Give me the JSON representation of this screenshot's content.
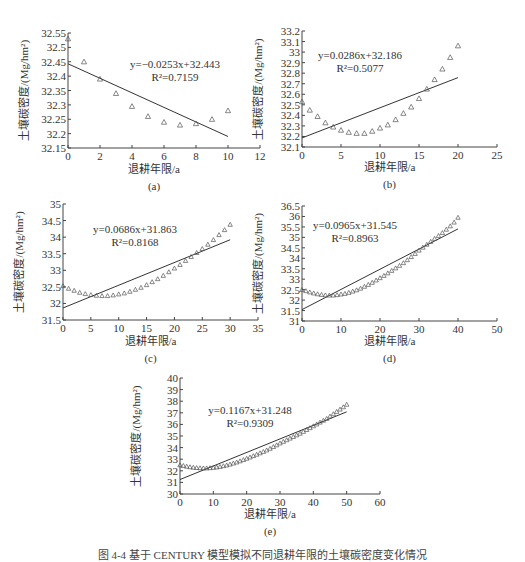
{
  "figure": {
    "caption": "图 4-4  基于 CENTURY 模型模拟不同退耕年限的土壤碳密度变化情况"
  },
  "common": {
    "ylabel": "土壤碳密度/(Mg/hm²)",
    "xlabel": "退耕年限/a"
  },
  "chart_data": [
    {
      "id": "a",
      "type": "scatter",
      "label": "(a)",
      "title": "",
      "xlabel": "退耕年限/a",
      "ylabel": "土壤碳密度/(Mg/hm²)",
      "xlim": [
        0,
        12
      ],
      "ylim": [
        32.15,
        32.55
      ],
      "xticks": [
        0,
        2,
        4,
        6,
        8,
        10,
        12
      ],
      "yticks": [
        32.15,
        32.2,
        32.25,
        32.3,
        32.35,
        32.4,
        32.45,
        32.5,
        32.55
      ],
      "ytick_labels": [
        "32.15",
        "32.2",
        "32.25",
        "32.3",
        "32.35",
        "32.4",
        "32.45",
        "32.5",
        "32.55"
      ],
      "x": [
        0,
        1,
        2,
        3,
        4,
        5,
        6,
        7,
        8,
        9,
        10
      ],
      "values": [
        32.53,
        32.45,
        32.39,
        32.34,
        32.295,
        32.26,
        32.24,
        32.23,
        32.235,
        32.25,
        32.28
      ],
      "trendline": {
        "slope": -0.0253,
        "intercept": 32.443,
        "x_range": [
          0,
          10
        ]
      },
      "equation": "y=−0.0253x+32.443",
      "r2": "R²=0.7159",
      "grid": false,
      "legend": "none"
    },
    {
      "id": "b",
      "type": "scatter",
      "label": "(b)",
      "title": "",
      "xlabel": "退耕年限/a",
      "ylabel": "土壤碳密度/(Mg/hm²)",
      "xlim": [
        0,
        25
      ],
      "ylim": [
        32.1,
        33.2
      ],
      "xticks": [
        0,
        5,
        10,
        15,
        20,
        25
      ],
      "yticks": [
        32.1,
        32.2,
        32.3,
        32.4,
        32.5,
        32.6,
        32.7,
        32.8,
        32.9,
        33,
        33.1,
        33.2
      ],
      "ytick_labels": [
        "32.1",
        "32.2",
        "32.3",
        "32.4",
        "32.5",
        "32.6",
        "32.7",
        "32.8",
        "32.9",
        "33",
        "33.1",
        "33.2"
      ],
      "x": [
        0,
        1,
        2,
        3,
        4,
        5,
        6,
        7,
        8,
        9,
        10,
        11,
        12,
        13,
        14,
        15,
        16,
        17,
        18,
        19,
        20
      ],
      "values": [
        32.53,
        32.45,
        32.39,
        32.33,
        32.29,
        32.26,
        32.24,
        32.23,
        32.23,
        32.25,
        32.28,
        32.31,
        32.36,
        32.42,
        32.48,
        32.56,
        32.65,
        32.74,
        32.84,
        32.95,
        33.06
      ],
      "trendline": {
        "slope": 0.0286,
        "intercept": 32.186,
        "x_range": [
          0,
          20
        ]
      },
      "equation": "y=0.0286x+32.186",
      "r2": "R²=0.5077",
      "grid": false,
      "legend": "none"
    },
    {
      "id": "c",
      "type": "scatter",
      "label": "(c)",
      "title": "",
      "xlabel": "退耕年限/a",
      "ylabel": "土壤碳密度/(Mg/hm²)",
      "xlim": [
        0,
        35
      ],
      "ylim": [
        31.5,
        35
      ],
      "xticks": [
        0,
        5,
        10,
        15,
        20,
        25,
        30,
        35
      ],
      "yticks": [
        31.5,
        32,
        32.5,
        33,
        33.5,
        34,
        34.5,
        35
      ],
      "ytick_labels": [
        "31.5",
        "32",
        "32.5",
        "33",
        "33.5",
        "34",
        "34.5",
        "35"
      ],
      "x": [
        0,
        1,
        2,
        3,
        4,
        5,
        6,
        7,
        8,
        9,
        10,
        11,
        12,
        13,
        14,
        15,
        16,
        17,
        18,
        19,
        20,
        21,
        22,
        23,
        24,
        25,
        26,
        27,
        28,
        29,
        30
      ],
      "values": [
        32.53,
        32.45,
        32.39,
        32.33,
        32.29,
        32.26,
        32.24,
        32.23,
        32.23,
        32.25,
        32.28,
        32.31,
        32.36,
        32.42,
        32.48,
        32.56,
        32.65,
        32.74,
        32.84,
        32.95,
        33.06,
        33.17,
        33.29,
        33.41,
        33.53,
        33.65,
        33.78,
        33.92,
        34.07,
        34.22,
        34.38
      ],
      "trendline": {
        "slope": 0.0686,
        "intercept": 31.863,
        "x_range": [
          0,
          30
        ]
      },
      "equation": "y=0.0686x+31.863",
      "r2": "R²=0.8168",
      "grid": false,
      "legend": "none"
    },
    {
      "id": "d",
      "type": "scatter",
      "label": "(d)",
      "title": "",
      "xlabel": "退耕年限/a",
      "ylabel": "土壤碳密度/(Mg/hm²)",
      "xlim": [
        0,
        50
      ],
      "ylim": [
        31,
        36.5
      ],
      "xticks": [
        0,
        10,
        20,
        30,
        40,
        50
      ],
      "yticks": [
        31,
        31.5,
        32,
        32.5,
        33,
        33.5,
        34,
        34.5,
        35,
        35.5,
        36,
        36.5
      ],
      "ytick_labels": [
        "31",
        "31.5",
        "32",
        "32.5",
        "33",
        "33.5",
        "34",
        "34.5",
        "35",
        "35.5",
        "36",
        "36.5"
      ],
      "x": [
        0,
        1,
        2,
        3,
        4,
        5,
        6,
        7,
        8,
        9,
        10,
        11,
        12,
        13,
        14,
        15,
        16,
        17,
        18,
        19,
        20,
        21,
        22,
        23,
        24,
        25,
        26,
        27,
        28,
        29,
        30,
        31,
        32,
        33,
        34,
        35,
        36,
        37,
        38,
        39,
        40
      ],
      "values": [
        32.5,
        32.44,
        32.38,
        32.33,
        32.29,
        32.26,
        32.24,
        32.23,
        32.23,
        32.25,
        32.28,
        32.31,
        32.36,
        32.42,
        32.48,
        32.56,
        32.65,
        32.74,
        32.84,
        32.95,
        33.06,
        33.17,
        33.29,
        33.41,
        33.53,
        33.65,
        33.78,
        33.92,
        34.07,
        34.22,
        34.38,
        34.52,
        34.66,
        34.8,
        34.94,
        35.08,
        35.22,
        35.38,
        35.54,
        35.72,
        35.95
      ],
      "trendline": {
        "slope": 0.0965,
        "intercept": 31.545,
        "x_range": [
          0,
          40
        ]
      },
      "equation": "y=0.0965x+31.545",
      "r2": "R²=0.8963",
      "grid": false,
      "legend": "none"
    },
    {
      "id": "e",
      "type": "scatter",
      "label": "(e)",
      "title": "",
      "xlabel": "退耕年限/a",
      "ylabel": "土壤碳密度/(Mg/hm²)",
      "xlim": [
        0,
        60
      ],
      "ylim": [
        30,
        40
      ],
      "xticks": [
        0,
        10,
        20,
        30,
        40,
        50,
        60
      ],
      "yticks": [
        30,
        31,
        32,
        33,
        34,
        35,
        36,
        37,
        38,
        39,
        40
      ],
      "ytick_labels": [
        "30",
        "31",
        "32",
        "33",
        "34",
        "35",
        "36",
        "37",
        "38",
        "39",
        "40"
      ],
      "x": [
        0,
        1,
        2,
        3,
        4,
        5,
        6,
        7,
        8,
        9,
        10,
        11,
        12,
        13,
        14,
        15,
        16,
        17,
        18,
        19,
        20,
        21,
        22,
        23,
        24,
        25,
        26,
        27,
        28,
        29,
        30,
        31,
        32,
        33,
        34,
        35,
        36,
        37,
        38,
        39,
        40,
        41,
        42,
        43,
        44,
        45,
        46,
        47,
        48,
        49,
        50
      ],
      "values": [
        32.5,
        32.44,
        32.38,
        32.33,
        32.29,
        32.26,
        32.24,
        32.23,
        32.23,
        32.25,
        32.28,
        32.31,
        32.36,
        32.42,
        32.48,
        32.56,
        32.65,
        32.74,
        32.84,
        32.95,
        33.06,
        33.17,
        33.29,
        33.41,
        33.53,
        33.65,
        33.78,
        33.92,
        34.07,
        34.22,
        34.38,
        34.52,
        34.66,
        34.8,
        34.94,
        35.08,
        35.22,
        35.38,
        35.54,
        35.7,
        35.86,
        36.02,
        36.18,
        36.34,
        36.5,
        36.7,
        36.9,
        37.1,
        37.3,
        37.5,
        37.72
      ],
      "trendline": {
        "slope": 0.1167,
        "intercept": 31.248,
        "x_range": [
          0,
          50
        ]
      },
      "equation": "y=0.1167x+31.248",
      "r2": "R²=0.9309",
      "grid": false,
      "legend": "none"
    }
  ]
}
